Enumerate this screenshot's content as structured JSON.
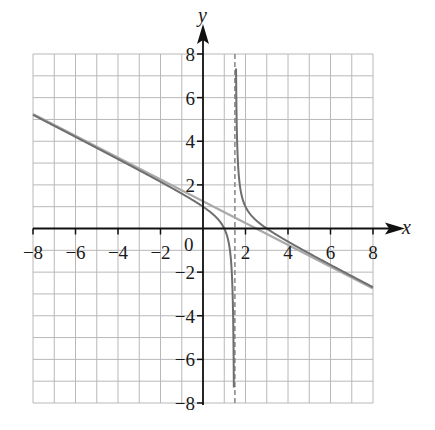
{
  "chart_data": {
    "type": "line",
    "title": "",
    "xlabel": "x",
    "ylabel": "y",
    "xlim": [
      -8,
      8
    ],
    "ylim": [
      -8,
      8
    ],
    "grid": true,
    "grid_step": 1,
    "x_ticks": [
      -8,
      -6,
      -4,
      -2,
      2,
      4,
      6,
      8
    ],
    "y_ticks": [
      8,
      6,
      4,
      2,
      -2,
      -4,
      -6,
      -8
    ],
    "x_tick_labels": [
      "−8",
      "−6",
      "−4",
      "−2",
      "2",
      "4",
      "6",
      "8"
    ],
    "y_tick_labels": [
      "8",
      "6",
      "4",
      "2",
      "−2",
      "−4",
      "−6",
      "−8"
    ],
    "origin_label": "0",
    "series": [
      {
        "name": "rational function",
        "description": "f(x) = (x^2 - 4x + 3) / (3 - 2x)",
        "style": "solid dark gray",
        "sample_points": [
          [
            -8,
            6.26
          ],
          [
            -4,
            3.18
          ],
          [
            0,
            1.0
          ],
          [
            1,
            0.0
          ],
          [
            1.3,
            -1.05
          ],
          [
            2,
            1.0
          ],
          [
            3,
            0.0
          ],
          [
            4,
            -0.6
          ],
          [
            6,
            -1.67
          ],
          [
            8,
            -2.85
          ]
        ]
      },
      {
        "name": "slant asymptote",
        "description": "y = -x/2 + 5/4",
        "style": "solid light gray",
        "sample_points": [
          [
            -8,
            5.25
          ],
          [
            0,
            1.25
          ],
          [
            2.5,
            0.0
          ],
          [
            8,
            -2.75
          ]
        ]
      },
      {
        "name": "vertical asymptote",
        "description": "x = 1.5",
        "style": "dashed gray",
        "sample_points": [
          [
            1.5,
            -8
          ],
          [
            1.5,
            8
          ]
        ]
      }
    ],
    "colors": {
      "grid": "#b8b8b8",
      "axis": "#111111",
      "curve": "#6e6e6e",
      "asymptote_line": "#a9a9a9",
      "vertical_asymptote": "#8c8c8c"
    }
  }
}
